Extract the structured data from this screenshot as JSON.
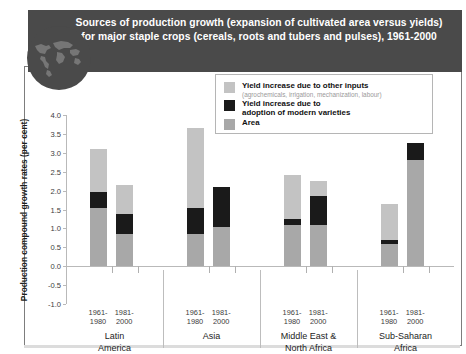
{
  "banner": {
    "title": "Sources of production growth (expansion of cultivated area versus yields) for major staple crops (cereals, roots and tubers and pulses), 1961-2000",
    "background_color": "#4a4a4a",
    "text_color": "#ffffff"
  },
  "legend": {
    "position": "top-right-inside",
    "items": [
      {
        "label": "Yield increase due to other inputs",
        "sublabel": "(agrochemicals, irrigation, mechanization, labour)",
        "color": "#c3c3c3"
      },
      {
        "label": "Yield increase due to\nadoption of modern varieties",
        "line1": "Yield increase due to",
        "line2": "adoption of modern varieties",
        "sublabel": "",
        "color": "#1a1a1a"
      },
      {
        "label": "Area",
        "sublabel": "",
        "color": "#a8a8a8"
      }
    ]
  },
  "chart_data": {
    "type": "bar",
    "subtype": "stacked",
    "title": "Sources of production growth (expansion of cultivated area versus yields) for major staple crops (cereals, roots and tubers and pulses), 1961-2000",
    "xlabel": "",
    "ylabel": "Production compound growth rates (per cent)",
    "ylim": [
      -1.0,
      4.0
    ],
    "yticks": [
      -1.0,
      -0.5,
      0.0,
      0.5,
      1.0,
      1.5,
      2.0,
      2.5,
      3.0,
      3.5,
      4.0
    ],
    "ytick_labels": [
      "-1.0",
      "-0.5",
      "0.0",
      "0.5",
      "1.0",
      "1.5",
      "2.0",
      "2.5",
      "3.0",
      "3.5",
      "4.0"
    ],
    "grid": false,
    "zero_line": true,
    "categories": [
      "Latin America",
      "Asia",
      "Middle East & North Africa",
      "Sub-Saharan Africa"
    ],
    "periods": [
      "1961-1980",
      "1981-2000"
    ],
    "period_label_lines": [
      [
        "1961-",
        "1980"
      ],
      [
        "1981-",
        "2000"
      ]
    ],
    "series": [
      {
        "name": "Area",
        "color": "#a8a8a8",
        "values": [
          [
            1.55,
            0.85
          ],
          [
            0.85,
            1.05
          ],
          [
            1.1,
            1.1
          ],
          [
            0.6,
            2.8
          ]
        ]
      },
      {
        "name": "Yield increase due to adoption of modern varieties",
        "color": "#1a1a1a",
        "values": [
          [
            0.42,
            0.52
          ],
          [
            0.7,
            1.05
          ],
          [
            0.15,
            0.75
          ],
          [
            0.08,
            0.45
          ]
        ]
      },
      {
        "name": "Yield increase due to other inputs",
        "color": "#c3c3c3",
        "values": [
          [
            1.13,
            0.78
          ],
          [
            2.1,
            0.0
          ],
          [
            1.17,
            0.4
          ],
          [
            0.97,
            0.0
          ]
        ]
      }
    ],
    "bar_totals": [
      [
        3.1,
        2.15
      ],
      [
        3.65,
        2.1
      ],
      [
        2.42,
        2.25
      ],
      [
        1.65,
        3.25
      ]
    ]
  }
}
